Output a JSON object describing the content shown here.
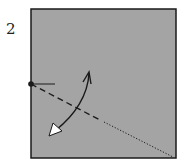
{
  "step": {
    "number": "2"
  },
  "diagram": {
    "paper_color": "#a4a4a4",
    "border_color": "#1a1a1a",
    "line_color": "#1a1a1a",
    "arrow_head_fill": "#ffffff",
    "square": {
      "x": 31,
      "y": 9,
      "width": 145,
      "height": 149
    },
    "reference_point": {
      "x": 31,
      "y": 84
    },
    "valley_fold_line": {
      "from": [
        31,
        84
      ],
      "to": [
        100,
        120
      ],
      "style": "dashed"
    },
    "existing_crease": {
      "from": [
        104,
        122
      ],
      "to": [
        173,
        157
      ],
      "style": "dotted"
    },
    "fold_arrow": {
      "type": "fold-and-unfold",
      "from": [
        89,
        72
      ],
      "to": [
        52,
        134
      ]
    },
    "tick_mark": {
      "from": [
        31,
        84
      ],
      "to": [
        55,
        84
      ]
    }
  }
}
